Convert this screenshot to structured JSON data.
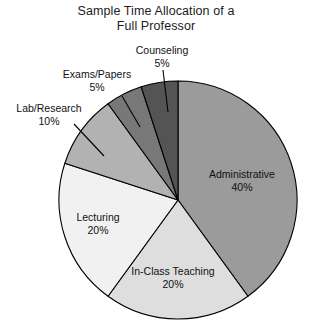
{
  "chart_data": {
    "type": "pie",
    "title": "Sample Time Allocation of a Full Professor",
    "title_line1": "Sample Time Allocation of a",
    "title_line2": "Full Professor",
    "xlabel": "",
    "ylabel": "",
    "legend": "none",
    "grid": false,
    "start_angle_deg": 0,
    "direction": "clockwise",
    "categories": [
      "Administrative",
      "In-Class Teaching",
      "Lecturing",
      "Lab/Research",
      "Exams/Papers",
      "Counseling"
    ],
    "values": [
      40,
      20,
      20,
      10,
      5,
      5
    ],
    "value_labels": [
      "40%",
      "20%",
      "20%",
      "10%",
      "5%",
      "5%"
    ],
    "units": "percent",
    "total": 100,
    "slices": [
      {
        "label": "Administrative",
        "value": 40,
        "value_label": "40%",
        "color": "#9b9b9b",
        "label_placement": "inside"
      },
      {
        "label": "In-Class Teaching",
        "value": 20,
        "value_label": "20%",
        "color": "#dedede",
        "label_placement": "inside"
      },
      {
        "label": "Lecturing",
        "value": 20,
        "value_label": "20%",
        "color": "#f1f1f1",
        "label_placement": "inside"
      },
      {
        "label": "Lab/Research",
        "value": 10,
        "value_label": "10%",
        "color": "#b2b2b2",
        "label_placement": "callout"
      },
      {
        "label": "Exams/Papers",
        "value": 5,
        "value_label": "5%",
        "color": "#787878",
        "label_placement": "callout"
      },
      {
        "label": "Counseling",
        "value": 5,
        "value_label": "5%",
        "color": "#545454",
        "label_placement": "callout"
      }
    ],
    "colors": {
      "outline": "#000000",
      "background": "#ffffff",
      "text": "#111111"
    }
  }
}
